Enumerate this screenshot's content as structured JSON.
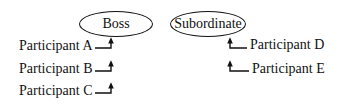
{
  "diagram": {
    "nodes": {
      "boss": {
        "label": "Boss"
      },
      "subordinate": {
        "label": "Subordinate"
      }
    },
    "left_group": {
      "target": "Boss",
      "participants": [
        {
          "label": "Participant A"
        },
        {
          "label": "Participant B"
        },
        {
          "label": "Participant C"
        }
      ]
    },
    "right_group": {
      "target": "Subordinate",
      "participants": [
        {
          "label": "Participant D"
        },
        {
          "label": "Participant E"
        }
      ]
    },
    "colors": {
      "stroke": "#111111",
      "background": "#ffffff"
    }
  }
}
